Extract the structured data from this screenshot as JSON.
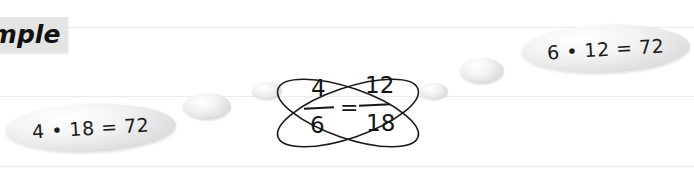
{
  "diagram": {
    "title_label": "ample",
    "type": "cross-multiplication proportion",
    "equation": {
      "left_numerator": "4",
      "left_denominator": "6",
      "equals": "=",
      "right_numerator": "12",
      "right_denominator": "18"
    },
    "results": [
      {
        "id": "left-product",
        "text": "4 • 18 = 72"
      },
      {
        "id": "right-product",
        "text": "6 • 12 = 72"
      }
    ],
    "bubbles": [
      {
        "x": 183,
        "y": 93,
        "w": 48,
        "h": 27
      },
      {
        "x": 252,
        "y": 82,
        "w": 30,
        "h": 18
      },
      {
        "x": 420,
        "y": 83,
        "w": 28,
        "h": 17
      },
      {
        "x": 460,
        "y": 58,
        "w": 44,
        "h": 26
      }
    ],
    "colors": {
      "ink": "#151515",
      "bubble_fill": "#dcdcdc",
      "guide_line": "#efeae6",
      "label_background": "#e4e4e4"
    }
  }
}
